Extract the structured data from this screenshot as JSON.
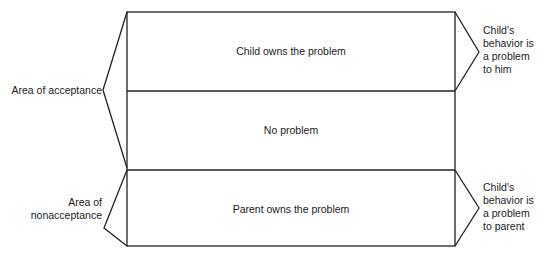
{
  "diagram": {
    "boxes": [
      {
        "label": "Child owns the problem"
      },
      {
        "label": "No problem"
      },
      {
        "label": "Parent owns the problem"
      }
    ],
    "left_labels": {
      "acceptance": "Area of acceptance",
      "nonacceptance_line1": "Area of",
      "nonacceptance_line2": "nonacceptance"
    },
    "right_labels": {
      "top": [
        "Child's",
        "behavior is",
        "a problem",
        "to him"
      ],
      "bottom": [
        "Child's",
        "behavior is",
        "a problem",
        "to parent"
      ]
    },
    "colors": {
      "line": "#222222",
      "background": "#ffffff"
    }
  }
}
